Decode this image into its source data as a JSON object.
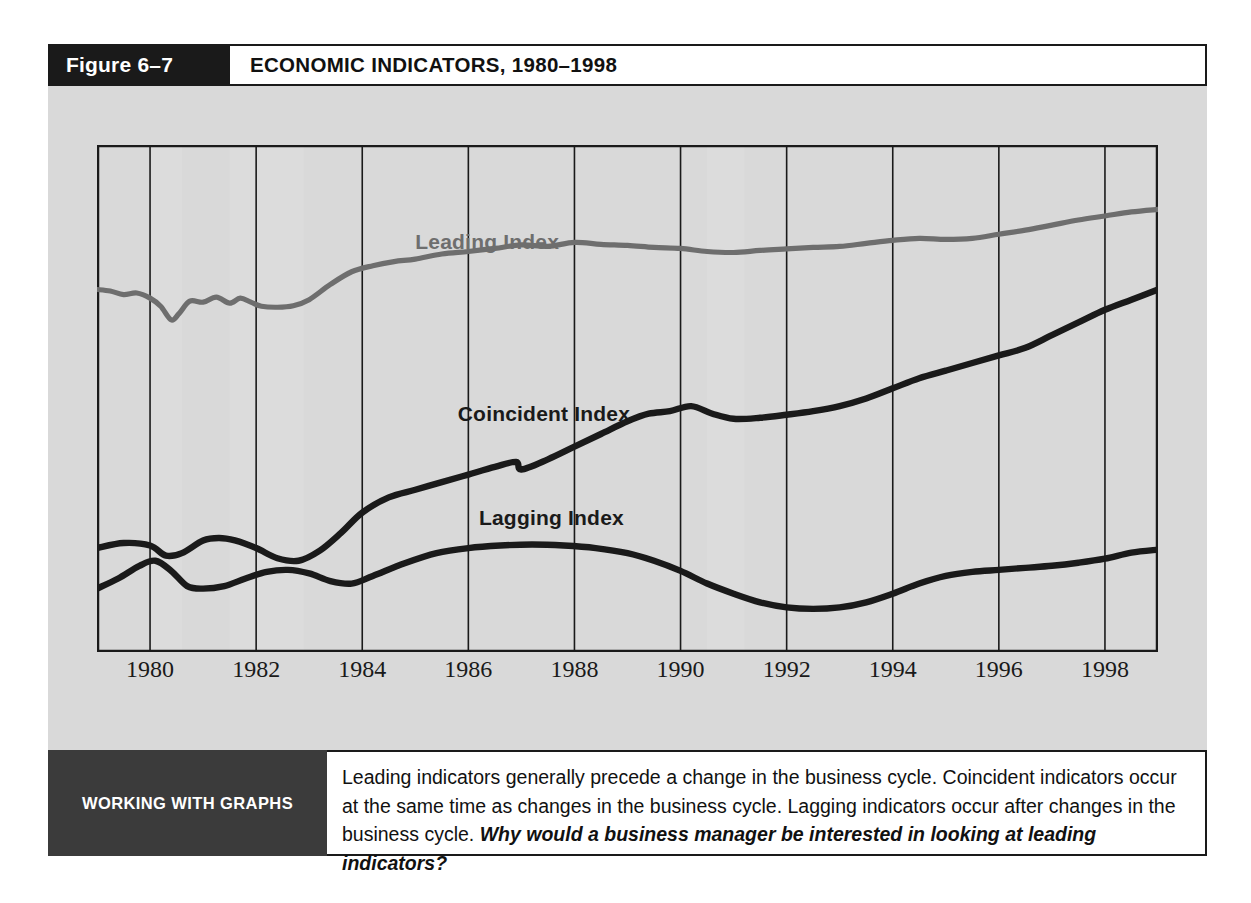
{
  "figure": {
    "number_label": "Figure 6–7",
    "title": "ECONOMIC INDICATORS, 1980–1998"
  },
  "colors": {
    "panel_background": "#d9d9d9",
    "plot_background": "#ffffff",
    "header_dark": "#1a1a1a",
    "caption_tag_dark": "#3b3b3b",
    "recession_band": "#dcdcdc",
    "leading_line": "#6e6e6e",
    "coincident_line": "#1a1a1a",
    "lagging_line": "#1a1a1a",
    "gridline": "#1a1a1a"
  },
  "caption": {
    "tag": "WORKING WITH GRAPHS",
    "text": "Leading indicators generally precede a change in the business cycle. Coincident indicators occur at the same time as changes in the business cycle. Lagging indicators occur after changes in the business cycle. ",
    "question": "Why would a business manager be interested in looking at leading indicators?"
  },
  "chart_data": {
    "type": "line",
    "title": "ECONOMIC INDICATORS, 1980–1998",
    "xlabel": "",
    "ylabel": "",
    "grid": "vertical-only",
    "legend": "inline-labels",
    "xlim": [
      1979.0,
      1999.0
    ],
    "ylim": [
      0,
      100
    ],
    "xticks": [
      1980,
      1982,
      1984,
      1986,
      1988,
      1990,
      1992,
      1994,
      1996,
      1998
    ],
    "xtick_labels": [
      "1980",
      "1982",
      "1984",
      "1986",
      "1988",
      "1990",
      "1992",
      "1994",
      "1996",
      "1998"
    ],
    "recession_bands": [
      {
        "start": 1980.0,
        "end": 1980.6,
        "label": "1980 recession"
      },
      {
        "start": 1981.5,
        "end": 1982.9,
        "label": "1981–1982 recession"
      },
      {
        "start": 1990.5,
        "end": 1991.2,
        "label": "1990–1991 recession"
      }
    ],
    "series": [
      {
        "name": "Leading Index",
        "color": "#6e6e6e",
        "label_x": 1985.0,
        "label_y": 80.5,
        "x": [
          1979.0,
          1979.25,
          1979.5,
          1979.75,
          1980.0,
          1980.2,
          1980.4,
          1980.55,
          1980.75,
          1981.0,
          1981.25,
          1981.5,
          1981.7,
          1981.9,
          1982.1,
          1982.4,
          1982.7,
          1983.0,
          1983.4,
          1983.8,
          1984.2,
          1984.6,
          1985.0,
          1985.5,
          1986.0,
          1986.5,
          1987.0,
          1987.5,
          1988.0,
          1988.5,
          1989.0,
          1989.5,
          1990.0,
          1990.5,
          1991.0,
          1991.5,
          1992.0,
          1992.5,
          1993.0,
          1993.5,
          1994.0,
          1994.5,
          1995.0,
          1995.5,
          1996.0,
          1996.5,
          1997.0,
          1997.5,
          1998.0,
          1998.5,
          1999.0
        ],
        "y": [
          71.5,
          71.2,
          70.5,
          70.8,
          69.8,
          68.2,
          65.5,
          66.8,
          69.2,
          69.0,
          70.0,
          68.8,
          69.8,
          69.0,
          68.2,
          68.0,
          68.3,
          69.5,
          72.5,
          75.0,
          76.2,
          77.0,
          77.5,
          78.5,
          79.0,
          79.6,
          80.3,
          80.0,
          80.8,
          80.4,
          80.2,
          79.8,
          79.6,
          79.0,
          78.8,
          79.2,
          79.5,
          79.8,
          80.0,
          80.6,
          81.2,
          81.6,
          81.4,
          81.6,
          82.4,
          83.2,
          84.2,
          85.2,
          86.0,
          86.8,
          87.3
        ]
      },
      {
        "name": "Coincident Index",
        "color": "#1a1a1a",
        "label_x": 1985.8,
        "label_y": 46.5,
        "x": [
          1979.0,
          1979.5,
          1980.0,
          1980.3,
          1980.6,
          1981.0,
          1981.3,
          1981.6,
          1982.0,
          1982.4,
          1982.8,
          1983.2,
          1983.6,
          1984.0,
          1984.5,
          1985.0,
          1985.5,
          1986.0,
          1986.5,
          1986.9,
          1987.0,
          1987.5,
          1988.0,
          1988.5,
          1989.0,
          1989.4,
          1989.8,
          1990.2,
          1990.6,
          1991.0,
          1991.5,
          1992.0,
          1992.5,
          1993.0,
          1993.5,
          1994.0,
          1994.5,
          1995.0,
          1995.5,
          1996.0,
          1996.5,
          1997.0,
          1997.5,
          1998.0,
          1998.5,
          1999.0
        ],
        "y": [
          20.5,
          21.5,
          21.0,
          19.0,
          19.5,
          22.0,
          22.5,
          22.0,
          20.5,
          18.5,
          18.0,
          20.0,
          23.5,
          27.5,
          30.5,
          32.0,
          33.5,
          35.0,
          36.5,
          37.5,
          36.0,
          38.0,
          40.5,
          43.0,
          45.5,
          47.0,
          47.5,
          48.5,
          47.0,
          46.0,
          46.2,
          46.8,
          47.5,
          48.5,
          50.0,
          52.0,
          54.0,
          55.5,
          57.0,
          58.5,
          60.0,
          62.5,
          65.0,
          67.5,
          69.5,
          71.5
        ]
      },
      {
        "name": "Lagging Index",
        "color": "#1a1a1a",
        "label_x": 1986.2,
        "label_y": 26.0,
        "x": [
          1979.0,
          1979.4,
          1979.8,
          1980.1,
          1980.4,
          1980.7,
          1981.0,
          1981.4,
          1981.8,
          1982.2,
          1982.6,
          1983.0,
          1983.4,
          1983.8,
          1984.2,
          1984.8,
          1985.4,
          1986.0,
          1986.6,
          1987.2,
          1987.8,
          1988.4,
          1989.0,
          1989.5,
          1990.0,
          1990.5,
          1991.0,
          1991.5,
          1992.0,
          1992.5,
          1993.0,
          1993.5,
          1994.0,
          1994.5,
          1995.0,
          1995.5,
          1996.0,
          1996.5,
          1997.0,
          1997.5,
          1998.0,
          1998.5,
          1999.0
        ],
        "y": [
          12.5,
          14.5,
          17.0,
          18.0,
          16.0,
          13.0,
          12.5,
          13.0,
          14.5,
          15.8,
          16.2,
          15.5,
          14.0,
          13.5,
          15.0,
          17.5,
          19.5,
          20.5,
          21.0,
          21.2,
          21.0,
          20.5,
          19.5,
          18.0,
          16.0,
          13.5,
          11.5,
          9.8,
          8.8,
          8.5,
          8.8,
          9.8,
          11.5,
          13.5,
          15.0,
          15.8,
          16.2,
          16.6,
          17.0,
          17.6,
          18.4,
          19.6,
          20.2
        ]
      }
    ]
  }
}
